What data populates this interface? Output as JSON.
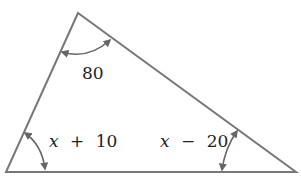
{
  "diagram": {
    "type": "triangle",
    "colors": {
      "stroke": "#777777",
      "text": "#222222",
      "background": "#ffffff"
    },
    "vertices": {
      "top": [
        78,
        13
      ],
      "left": [
        6,
        172
      ],
      "right": [
        296,
        172
      ]
    },
    "angles": {
      "top": {
        "label": "80"
      },
      "left": {
        "var": "x",
        "op": "+",
        "num": "10",
        "label": "x + 10"
      },
      "right": {
        "var": "x",
        "op": "−",
        "num": "20",
        "label": "x − 20"
      }
    }
  }
}
